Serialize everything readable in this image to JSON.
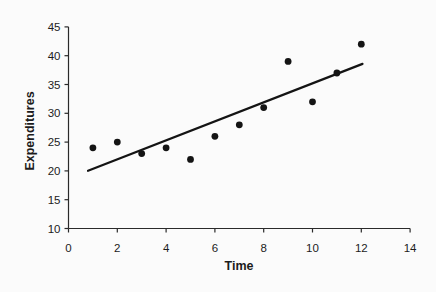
{
  "chart_data": {
    "type": "scatter",
    "title": "",
    "xlabel": "Time",
    "ylabel": "Expenditures",
    "xlim": [
      0,
      14
    ],
    "ylim": [
      10,
      45
    ],
    "x_ticks": [
      0,
      2,
      4,
      6,
      8,
      10,
      12,
      14
    ],
    "y_ticks": [
      10,
      15,
      20,
      25,
      30,
      35,
      40,
      45
    ],
    "grid": false,
    "legend": "none",
    "points": [
      {
        "x": 1,
        "y": 24
      },
      {
        "x": 2,
        "y": 25
      },
      {
        "x": 3,
        "y": 23
      },
      {
        "x": 4,
        "y": 24
      },
      {
        "x": 5,
        "y": 22
      },
      {
        "x": 6,
        "y": 26
      },
      {
        "x": 7,
        "y": 28
      },
      {
        "x": 8,
        "y": 31
      },
      {
        "x": 9,
        "y": 39
      },
      {
        "x": 10,
        "y": 32
      },
      {
        "x": 11,
        "y": 37
      },
      {
        "x": 12,
        "y": 42
      }
    ],
    "trendline": {
      "slope": 1.65,
      "intercept": 18.7,
      "x_start": 0.8,
      "x_end": 12.05
    },
    "colors": {
      "points": "#141414",
      "trendline": "#141414",
      "axis": "#2a2a2a",
      "text": "#1c1c1c",
      "background": "#fbfbfb"
    }
  }
}
